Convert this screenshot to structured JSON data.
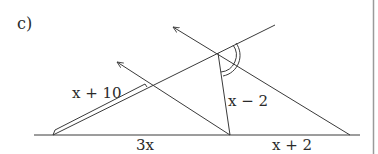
{
  "part_label": "c)",
  "labels": {
    "slant_segment": "x + 10",
    "left_base": "3x",
    "right_base": "x + 2",
    "middle_segment": "x − 2"
  },
  "colors": {
    "line": "#3a3a3a",
    "text": "#2a2a2a",
    "border": "#9a9a9a",
    "background": "#ffffff"
  }
}
